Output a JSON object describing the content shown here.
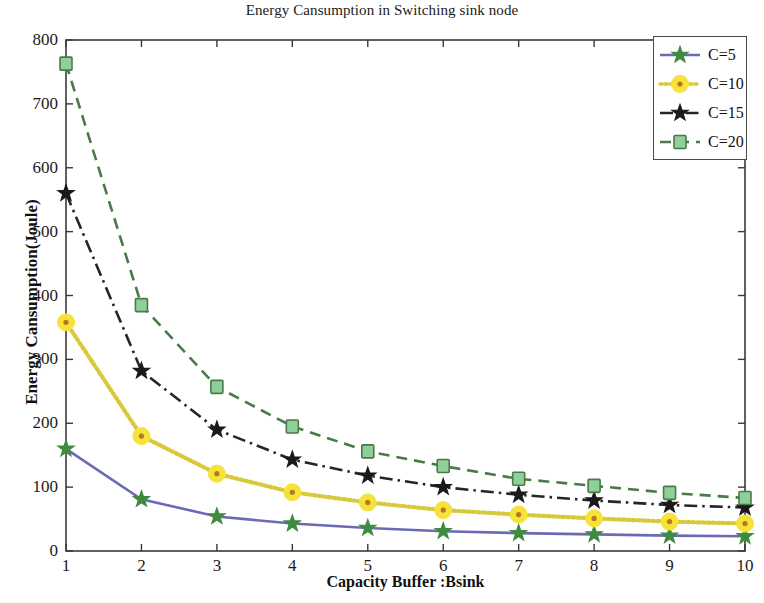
{
  "chart_data": {
    "type": "line",
    "title": "Energy Cansumption in Switching sink node",
    "xlabel": "Capacity Buffer :Bsink",
    "ylabel": "Energy Cansumption(Joule)",
    "x": [
      1,
      2,
      3,
      4,
      5,
      6,
      7,
      8,
      9,
      10
    ],
    "xlim": [
      1,
      10
    ],
    "ylim": [
      0,
      800
    ],
    "xticks": [
      "1",
      "2",
      "3",
      "4",
      "5",
      "6",
      "7",
      "8",
      "9",
      "10"
    ],
    "yticks": [
      "0",
      "100",
      "200",
      "300",
      "400",
      "500",
      "600",
      "700",
      "800"
    ],
    "grid": false,
    "legend_position": "top-right",
    "series": [
      {
        "name": "C=5",
        "values": [
          160,
          81,
          54,
          43,
          36,
          31,
          28,
          26,
          24,
          23
        ],
        "color": "#6a6ab5",
        "line_style": "solid",
        "marker": "star",
        "marker_color": "#3f8b3f"
      },
      {
        "name": "C=10",
        "values": [
          358,
          180,
          121,
          92,
          76,
          64,
          57,
          51,
          46,
          43
        ],
        "color": "#d8c83a",
        "line_style": "dotted",
        "marker": "circle",
        "marker_color": "#f7e23a"
      },
      {
        "name": "C=15",
        "values": [
          560,
          282,
          190,
          143,
          118,
          100,
          88,
          79,
          72,
          68
        ],
        "color": "#262626",
        "line_style": "dashdot",
        "marker": "star",
        "marker_color": "#1a1a1a"
      },
      {
        "name": "C=20",
        "values": [
          763,
          385,
          257,
          195,
          156,
          133,
          113,
          102,
          91,
          83
        ],
        "color": "#4a7a4a",
        "line_style": "dashed",
        "marker": "square",
        "marker_color": "#8fcf9a"
      }
    ]
  },
  "legend": {
    "entries": [
      "C=5",
      "C=10",
      "C=15",
      "C=20"
    ]
  },
  "axes": {
    "frame_color": "#3a3a3a",
    "background": "#ffffff"
  }
}
